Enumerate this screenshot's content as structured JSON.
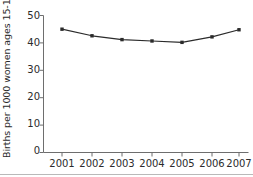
{
  "chart_data": {
    "type": "line",
    "title": "",
    "subtitle": "",
    "xlabel": "",
    "ylabel": "Births per 1000 women ages 15-19",
    "categories": [
      "2001",
      "2002",
      "2003",
      "2004",
      "2005",
      "2006",
      "2007"
    ],
    "x": [
      2001,
      2002,
      2003,
      2004,
      2005,
      2006,
      2007
    ],
    "values": [
      45.0,
      42.6,
      41.2,
      40.7,
      40.2,
      42.2,
      44.8
    ],
    "series": [
      {
        "name": "Births per 1000 women ages 15-19",
        "values": [
          45.0,
          42.6,
          41.2,
          40.7,
          40.2,
          42.2,
          44.8
        ],
        "color": "#2b2b2b",
        "marker": "square",
        "line_style": "solid"
      }
    ],
    "ylim": [
      0,
      50
    ],
    "yticks": [
      0,
      10,
      20,
      30,
      40,
      50
    ],
    "ytick_labels": [
      "0",
      "10",
      "20",
      "30",
      "40",
      "50"
    ],
    "xtick_labels": [
      "2001",
      "2002",
      "2003",
      "2004",
      "2005",
      "2006",
      "2007"
    ],
    "grid": false,
    "legend": false,
    "legend_position": "none",
    "axis_color": "#6e6e6e",
    "text_color": "#2b2b2b",
    "background": "#ffffff"
  },
  "axes": {
    "y_axis_label": "Births per 1000 women ages 15-19",
    "y_tick_labels": [
      "50",
      "40",
      "30",
      "20",
      "10",
      "0"
    ],
    "x_tick_labels": [
      "2001",
      "2002",
      "2003",
      "2004",
      "2005",
      "2006",
      "2007"
    ]
  }
}
